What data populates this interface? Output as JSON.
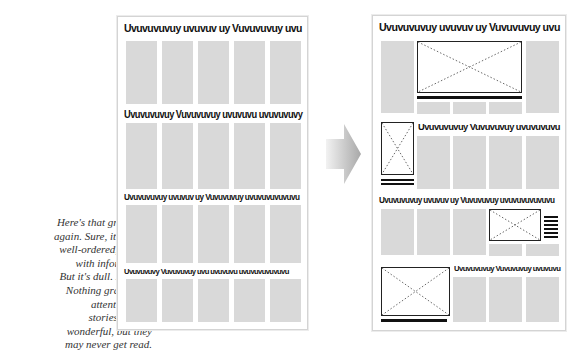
{
  "caption": {
    "lines": [
      "Here's that gray page",
      "again. Sure, it's clean,",
      "well-ordered, packed",
      "with information.",
      "But it's dull. Lifeless.",
      "Nothing grabs your",
      "attention. The",
      "stories may be",
      "wonderful, but they",
      "may never get read."
    ]
  },
  "before_page": {
    "headlines": [
      "Uvuvuvuvuy uvuvuv uy Vuvuvuvuy uvu",
      "Uvuvuvuvuy Vuvuvuvuy uvuvuvu uvuvuvuvy",
      "Uvuvuvuvuy uvuvuv uy Vuvuvuvuy uvuvuvuvuvuvu",
      "Uvuvuvuvy Vuvuvuvuy uvu uvuvuvu uvuvuvuvuvuvu"
    ]
  },
  "after_page": {
    "headlines": [
      "Uvuvuvuvuy uvuvuv uy Vuvuvuvuy uvu",
      "Uvuvuvuvuy Vuvuvuvuy uvuvuvuvu",
      "Uvuvuvuvuy uvuvuv uy Vuvuvuvuy uvuvuvuvuvuvu",
      "Uvuvuvuvuy Vuvuvuvuy uvuvuvu"
    ]
  },
  "arrow": {
    "direction": "right",
    "color_from": "#f2f2f2",
    "color_to": "#a8a8a8"
  },
  "colors": {
    "column_gray": "#d9d9d9",
    "page_border": "#d4d4d4",
    "ink": "#111111"
  }
}
